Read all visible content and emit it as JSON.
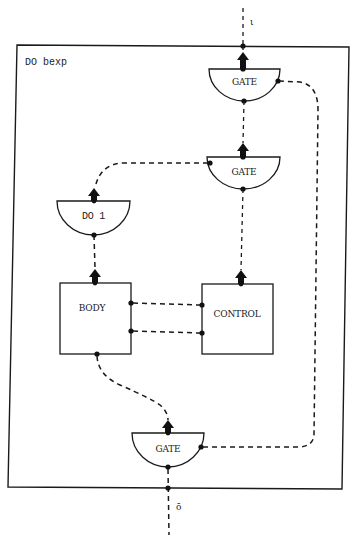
{
  "diagram": {
    "frame_label": "DO bexp",
    "input_label": "ι",
    "output_label": "ō",
    "nodes": {
      "gate_top": {
        "label": "GATE",
        "shape": "half-disc"
      },
      "gate_middle": {
        "label": "GATE",
        "shape": "half-disc"
      },
      "do1": {
        "label": "DO 1",
        "shape": "half-disc"
      },
      "body": {
        "label": "BODY",
        "shape": "box"
      },
      "control": {
        "label": "CONTROL",
        "shape": "box"
      },
      "gate_bottom": {
        "label": "GATE",
        "shape": "half-disc"
      }
    },
    "edges": [
      {
        "from": "gate_top",
        "to": "input",
        "style": "dashed",
        "arrow": "up"
      },
      {
        "from": "gate_middle",
        "to": "gate_top",
        "style": "dashed",
        "arrow": "up"
      },
      {
        "from": "gate_middle",
        "to": "do1",
        "style": "dashed"
      },
      {
        "from": "do1",
        "to": "body",
        "style": "dashed",
        "arrow": "up"
      },
      {
        "from": "control",
        "to": "gate_middle",
        "style": "dashed",
        "arrow": "up"
      },
      {
        "from": "body",
        "to": "control",
        "style": "dashed",
        "count": 2
      },
      {
        "from": "body",
        "to": "gate_bottom",
        "style": "dashed",
        "arrow": "up"
      },
      {
        "from": "gate_bottom",
        "to": "gate_top",
        "style": "dashed"
      },
      {
        "from": "output",
        "to": "gate_bottom",
        "style": "dashed"
      }
    ]
  }
}
